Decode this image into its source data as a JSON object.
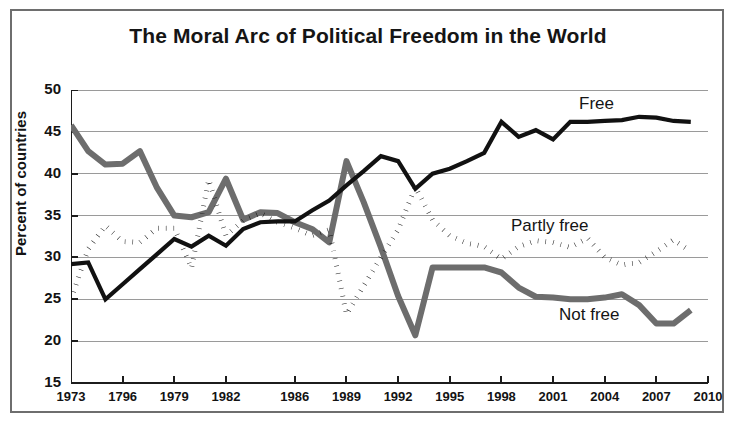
{
  "figure": {
    "title": "The Moral Arc of Political Freedom in the World"
  },
  "axes": {
    "ylabel": "Percent of countries",
    "xlabel": "",
    "yticks": [
      "50",
      "45",
      "40",
      "35",
      "30",
      "25",
      "20",
      "15"
    ],
    "xticks": [
      "1973",
      "1796",
      "1979",
      "1982",
      "1986",
      "1989",
      "1992",
      "1995",
      "1998",
      "2001",
      "2004",
      "2007",
      "2010"
    ]
  },
  "series_labels": {
    "free": "Free",
    "partly_free": "Partly free",
    "not_free": "Not free"
  },
  "colors": {
    "free": "#111111",
    "partly_free": "#111111",
    "not_free": "#6d6d6d",
    "gridline": "#9a9a9a",
    "axis": "#1c1c1c",
    "background": "#ffffff"
  },
  "chart_data": {
    "type": "line",
    "title": "The Moral Arc of Political Freedom in the World",
    "xlabel": "",
    "ylabel": "Percent of countries",
    "xlim": [
      1973,
      2010
    ],
    "ylim": [
      15,
      50
    ],
    "ytick_values": [
      15,
      20,
      25,
      30,
      35,
      40,
      45,
      50
    ],
    "xtick_values": [
      1973,
      1976,
      1979,
      1982,
      1986,
      1989,
      1992,
      1995,
      1998,
      2001,
      2004,
      2007,
      2010
    ],
    "xtick_labels": [
      "1973",
      "1796",
      "1979",
      "1982",
      "1986",
      "1989",
      "1992",
      "1995",
      "1998",
      "2001",
      "2004",
      "2007",
      "2010"
    ],
    "grid": "horizontal",
    "legend": "inline-annotations",
    "note": "X tick label '1796' appears as a typo in the source figure for 1976.",
    "x": [
      1973,
      1974,
      1975,
      1976,
      1977,
      1978,
      1979,
      1980,
      1981,
      1982,
      1983,
      1984,
      1985,
      1986,
      1987,
      1988,
      1989,
      1990,
      1991,
      1992,
      1993,
      1994,
      1995,
      1996,
      1997,
      1998,
      1999,
      2000,
      2001,
      2002,
      2003,
      2004,
      2005,
      2006,
      2007,
      2008,
      2009
    ],
    "series": [
      {
        "name": "Free",
        "style": "solid-black",
        "values": [
          29.2,
          29.4,
          25.0,
          26.8,
          28.6,
          30.4,
          32.2,
          31.3,
          32.6,
          31.4,
          33.4,
          34.2,
          34.3,
          34.3,
          35.6,
          36.8,
          38.6,
          40.3,
          42.1,
          41.5,
          38.2,
          40.0,
          40.6,
          41.5,
          42.5,
          46.2,
          44.4,
          45.2,
          44.1,
          46.2,
          46.2,
          46.3,
          46.4,
          46.8,
          46.7,
          46.3,
          46.2
        ]
      },
      {
        "name": "Partly free",
        "style": "dotted-black",
        "values": [
          25.0,
          31.0,
          33.8,
          31.9,
          31.8,
          33.5,
          33.5,
          28.7,
          39.3,
          32.6,
          34.4,
          35.3,
          34.2,
          33.5,
          32.6,
          33.3,
          23.2,
          26.6,
          30.0,
          33.3,
          38.4,
          34.5,
          32.6,
          31.7,
          31.3,
          29.8,
          31.3,
          32.0,
          31.8,
          31.2,
          32.3,
          30.0,
          29.1,
          29.4,
          30.7,
          32.1,
          30.7
        ]
      },
      {
        "name": "Not free",
        "style": "thick-gray",
        "values": [
          45.8,
          42.7,
          41.1,
          41.2,
          42.7,
          38.3,
          35.0,
          34.8,
          35.4,
          39.4,
          34.5,
          35.4,
          35.3,
          34.2,
          33.4,
          31.8,
          41.5,
          36.6,
          31.2,
          25.4,
          20.7,
          28.8,
          28.8,
          28.8,
          28.8,
          28.2,
          26.4,
          25.3,
          25.2,
          25.0,
          25.0,
          25.2,
          25.6,
          24.3,
          22.1,
          22.1,
          23.7
        ]
      }
    ]
  }
}
